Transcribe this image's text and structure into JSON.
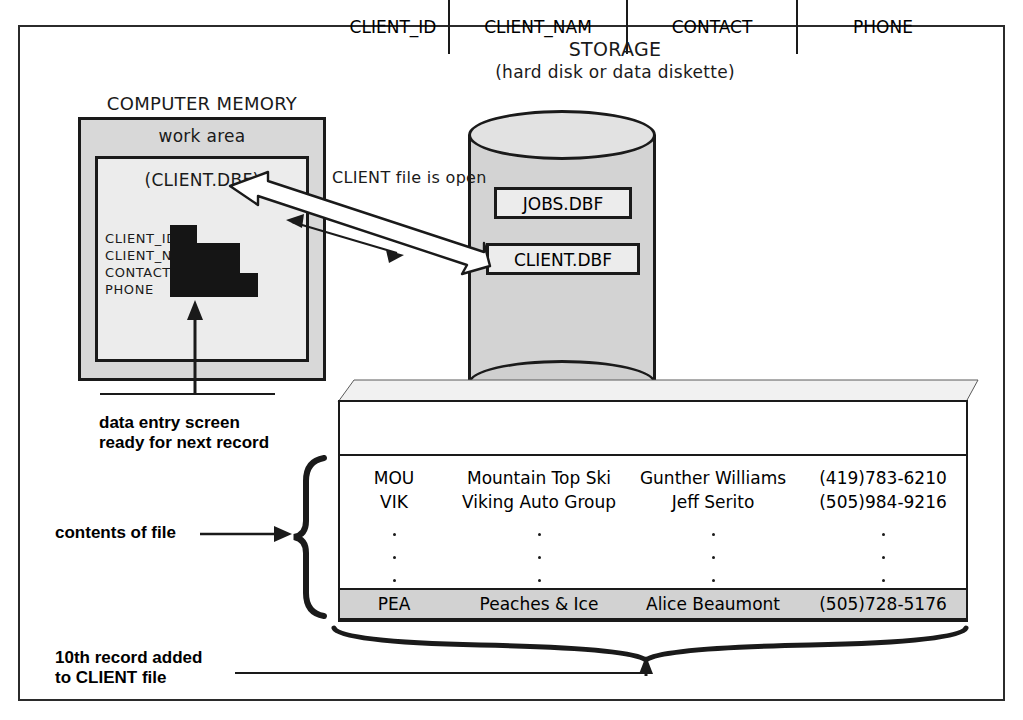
{
  "diagram": {
    "storage": {
      "title": "STORAGE",
      "subtitle": "(hard disk or data diskette)",
      "files": [
        "JOBS.DBF",
        "CLIENT.DBF"
      ]
    },
    "memory": {
      "title": "COMPUTER MEMORY",
      "work_area_label": "work area",
      "open_file_label": "(CLIENT.DBF)",
      "fields": [
        "CLIENT_ID",
        "CLIENT_NAM",
        "CONTACT",
        "PHONE"
      ]
    },
    "arrow_label": "CLIENT file is open",
    "annotations": {
      "data_entry": "data entry screen\nready for next record",
      "contents_of_file": "contents of file",
      "record_added": "10th record added\nto CLIENT file"
    }
  },
  "table": {
    "columns": [
      "CLIENT_ID",
      "CLIENT_NAM",
      "CONTACT",
      "PHONE"
    ],
    "rows": [
      [
        "MOU",
        "Mountain Top Ski",
        "Gunther Williams",
        "(419)783-6210"
      ],
      [
        "VIK",
        "Viking Auto Group",
        "Jeff Serito",
        "(505)984-9216"
      ]
    ],
    "ellipsis_rows": 3,
    "highlighted_row": [
      "PEA",
      "Peaches & Ice",
      "Alice Beaumont",
      "(505)728-5176"
    ]
  },
  "colors": {
    "line": "#1a1a1a",
    "memory_fill": "#d8d8d8",
    "work_area_fill": "#ececec",
    "cylinder_fill": "#d3d3d3",
    "fan_fill": "#dcdcdc",
    "highlight_row_fill": "#d2d2d2"
  }
}
